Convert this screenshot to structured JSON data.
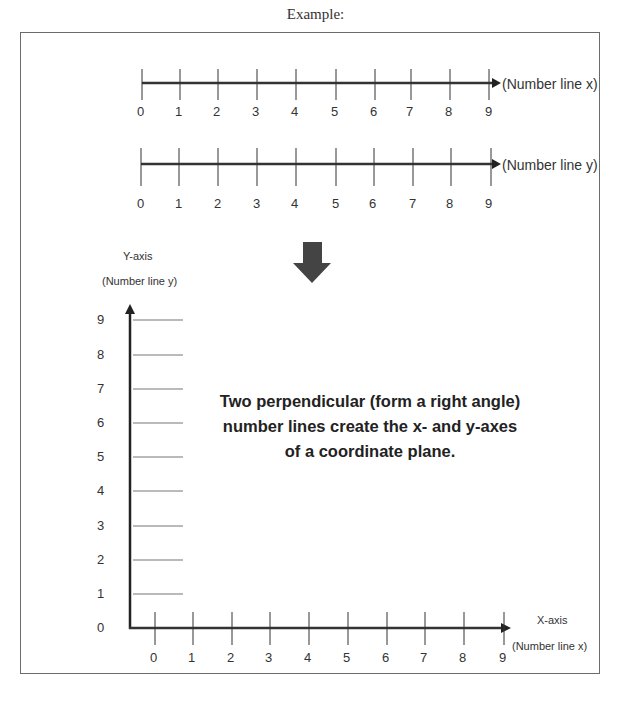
{
  "title": "Example:",
  "number_line_x": {
    "label": "(Number line x)",
    "ticks": [
      "0",
      "1",
      "2",
      "3",
      "4",
      "5",
      "6",
      "7",
      "8",
      "9"
    ]
  },
  "number_line_y": {
    "label": "(Number line y)",
    "ticks": [
      "0",
      "1",
      "2",
      "3",
      "4",
      "5",
      "6",
      "7",
      "8",
      "9"
    ]
  },
  "arrow": {
    "icon": "down-arrow-icon",
    "color": "#444444"
  },
  "coordinate_plane": {
    "y_axis_title": "Y-axis",
    "y_axis_subtitle": "(Number line y)",
    "x_axis_title": "X-axis",
    "x_axis_subtitle": "(Number line x)",
    "y_ticks": [
      "0",
      "1",
      "2",
      "3",
      "4",
      "5",
      "6",
      "7",
      "8",
      "9"
    ],
    "x_ticks": [
      "0",
      "1",
      "2",
      "3",
      "4",
      "5",
      "6",
      "7",
      "8",
      "9"
    ]
  },
  "description": "Two perpendicular (form a right angle) number lines create the x- and y-axes of a coordinate plane."
}
